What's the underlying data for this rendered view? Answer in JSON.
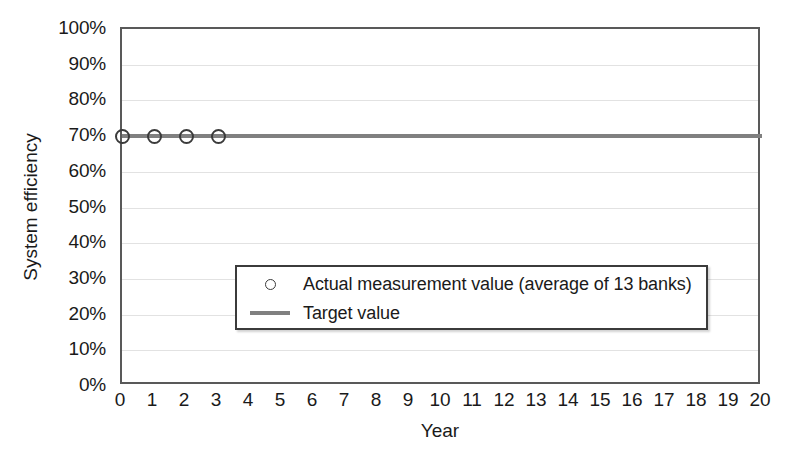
{
  "chart_data": {
    "type": "scatter",
    "title": "",
    "xlabel": "Year",
    "ylabel": "System efficiency",
    "xlim": [
      0,
      20
    ],
    "ylim": [
      0,
      100
    ],
    "grid": true,
    "legend_position": "inside-lower-left",
    "x_ticks": [
      0,
      1,
      2,
      3,
      4,
      5,
      6,
      7,
      8,
      9,
      10,
      11,
      12,
      13,
      14,
      15,
      16,
      17,
      18,
      19,
      20
    ],
    "x_tick_labels": [
      "0",
      "1",
      "2",
      "3",
      "4",
      "5",
      "6",
      "7",
      "8",
      "9",
      "10",
      "11",
      "12",
      "13",
      "14",
      "15",
      "16",
      "17",
      "18",
      "19",
      "20"
    ],
    "y_ticks": [
      0,
      10,
      20,
      30,
      40,
      50,
      60,
      70,
      80,
      90,
      100
    ],
    "y_tick_labels": [
      "0%",
      "10%",
      "20%",
      "30%",
      "40%",
      "50%",
      "60%",
      "70%",
      "80%",
      "90%",
      "100%"
    ],
    "series": [
      {
        "name": "Actual measurement value (average of 13 banks)",
        "type": "scatter",
        "marker": "open-circle",
        "color": "#3b3b3b",
        "x": [
          0,
          1,
          2,
          3
        ],
        "values": [
          70,
          70,
          70,
          70
        ]
      },
      {
        "name": "Target value",
        "type": "line",
        "color": "#808080",
        "x": [
          0,
          20
        ],
        "values": [
          70,
          70
        ],
        "constant_value": 70
      }
    ],
    "annotations": []
  },
  "axes": {
    "y_title": "System efficiency",
    "x_title": "Year"
  },
  "legend": {
    "entries": [
      {
        "label": "Actual measurement value (average of 13 banks)",
        "swatch": "open-circle-marker"
      },
      {
        "label": "Target value",
        "swatch": "solid-line"
      }
    ]
  },
  "colors": {
    "target_line": "#808080",
    "marker_stroke": "#3b3b3b",
    "axis": "#595959",
    "gridline": "#e2e2e2",
    "background": "#ffffff",
    "text": "#1a1a1a"
  }
}
